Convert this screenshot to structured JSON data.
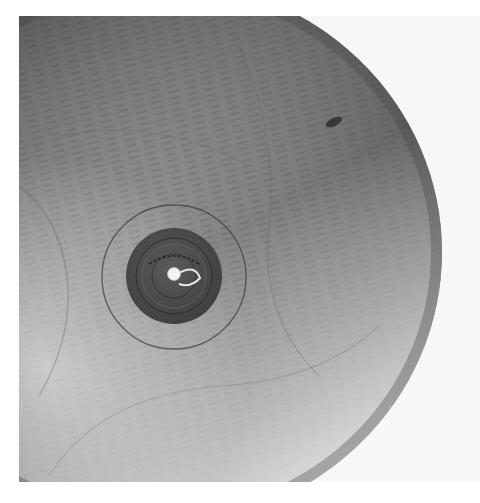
{
  "image": {
    "subject": "Wooden bowl basin with a rubber drain plug",
    "palette": {
      "background": "#ffffff",
      "backdrop": "#f5f5f5",
      "wood_dark": "#5e5e5e",
      "wood_mid": "#8a8a8a",
      "wood_light": "#d4d4d4",
      "plug": "#4a4a4a",
      "knob": "#f2f2f2"
    },
    "elements": {
      "bowl": {
        "label": "Wooden bowl interior"
      },
      "drain_ring": {
        "label": "Drain ring"
      },
      "drain_plug": {
        "label": "Rubber drain plug",
        "embossed_text": "EDWARDS"
      },
      "plug_knob": {
        "label": "Plug knob with loop"
      }
    }
  }
}
